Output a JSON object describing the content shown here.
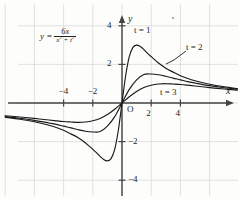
{
  "figure": {
    "equation": {
      "lhs": "y =",
      "numerator": "6x",
      "denominator_base1": "x",
      "denominator_exp1": "2",
      "denominator_plus": " + ",
      "denominator_base2": "t",
      "denominator_exp2": "2"
    },
    "origin_label": "O",
    "x_axis_name": "x",
    "y_axis_name": "y",
    "curve_labels": [
      {
        "text": "t = 1"
      },
      {
        "text": "t = 2"
      },
      {
        "text": "t = 3"
      }
    ]
  },
  "chart_data": {
    "type": "line",
    "title": "",
    "subtitle": "",
    "xlabel": "x",
    "ylabel": "y",
    "annotations": [
      {
        "text": "y = 6x/(x^2 + t^2)",
        "x": -3.5,
        "y": 3.4
      },
      {
        "text": "t = 1",
        "x": 1.1,
        "y": 3.9
      },
      {
        "text": "t = 2",
        "x": 4.6,
        "y": 2.6
      },
      {
        "text": "t = 3",
        "x": 2.7,
        "y": 0.7
      },
      {
        "text": "O",
        "x": 0.3,
        "y": -0.45
      }
    ],
    "grid": true,
    "grid_spacing_x": 2,
    "grid_spacing_y": 2,
    "legend_position": "inline-annotations",
    "xlim": [
      -8.2,
      7.9
    ],
    "ylim": [
      -5.0,
      4.6
    ],
    "xticks": [
      -4,
      -2,
      2,
      4
    ],
    "yticks": [
      4,
      2,
      -2,
      -4
    ],
    "xticklabels": [
      "−4",
      "−2",
      "2",
      "4"
    ],
    "yticklabels": [
      "4",
      "2",
      "−2",
      "−4"
    ],
    "series": [
      {
        "name": "t = 1",
        "formula": "6x/(x^2 + 1)",
        "peak": {
          "x": 1,
          "y": 3
        },
        "trough": {
          "x": -1,
          "y": -3
        },
        "x": [
          -8,
          -7,
          -6,
          -5,
          -4.5,
          -4,
          -3.5,
          -3,
          -2.5,
          -2,
          -1.75,
          -1.5,
          -1.25,
          -1,
          -0.75,
          -0.5,
          -0.25,
          0,
          0.25,
          0.5,
          0.75,
          1,
          1.25,
          1.5,
          1.75,
          2,
          2.5,
          3,
          3.5,
          4,
          4.5,
          5,
          6,
          7,
          7.9
        ],
        "y": [
          -0.738,
          -0.84,
          -0.973,
          -1.154,
          -1.268,
          -1.412,
          -1.6,
          -1.8,
          -2.069,
          -2.4,
          -2.571,
          -2.769,
          -2.927,
          -3,
          -2.88,
          -2.4,
          -1.412,
          0,
          1.412,
          2.4,
          2.88,
          3,
          2.927,
          2.769,
          2.571,
          2.4,
          2.069,
          1.8,
          1.6,
          1.412,
          1.268,
          1.154,
          0.973,
          0.84,
          0.747
        ]
      },
      {
        "name": "t = 2",
        "formula": "6x/(x^2 + 4)",
        "peak": {
          "x": 2,
          "y": 1.5
        },
        "trough": {
          "x": -2,
          "y": -1.5
        },
        "x": [
          -8,
          -7,
          -6,
          -5,
          -4.5,
          -4,
          -3.5,
          -3,
          -2.5,
          -2,
          -1.5,
          -1,
          -0.5,
          0,
          0.5,
          1,
          1.5,
          2,
          2.5,
          3,
          3.5,
          4,
          4.5,
          5,
          6,
          7,
          7.9
        ],
        "y": [
          -0.706,
          -0.792,
          -0.9,
          -1.034,
          -1.106,
          -1.2,
          -1.289,
          -1.385,
          -1.463,
          -1.5,
          -1.477,
          -1.2,
          -0.706,
          0,
          0.706,
          1.2,
          1.477,
          1.5,
          1.463,
          1.385,
          1.289,
          1.2,
          1.106,
          1.034,
          0.9,
          0.792,
          0.713
        ]
      },
      {
        "name": "t = 3",
        "formula": "6x/(x^2 + 9)",
        "peak": {
          "x": 3,
          "y": 1
        },
        "trough": {
          "x": -3,
          "y": -1
        },
        "x": [
          -8,
          -7,
          -6,
          -5,
          -4.5,
          -4,
          -3.5,
          -3,
          -2.5,
          -2,
          -1.5,
          -1,
          -0.5,
          0,
          0.5,
          1,
          1.5,
          2,
          2.5,
          3,
          3.5,
          4,
          4.5,
          5,
          6,
          7,
          7.9
        ],
        "y": [
          -0.658,
          -0.724,
          -0.8,
          -0.882,
          -0.924,
          -0.96,
          -0.982,
          -1,
          -0.984,
          -0.923,
          -0.8,
          -0.6,
          -0.324,
          0,
          0.324,
          0.6,
          0.8,
          0.923,
          0.984,
          1,
          0.982,
          0.96,
          0.924,
          0.882,
          0.8,
          0.724,
          0.665
        ]
      }
    ]
  },
  "colors": {
    "grid": "#d9d9d9",
    "axis": "#444444",
    "curve": "#1a1a1a",
    "text": "#231f20",
    "background": "#fdfdfc"
  }
}
